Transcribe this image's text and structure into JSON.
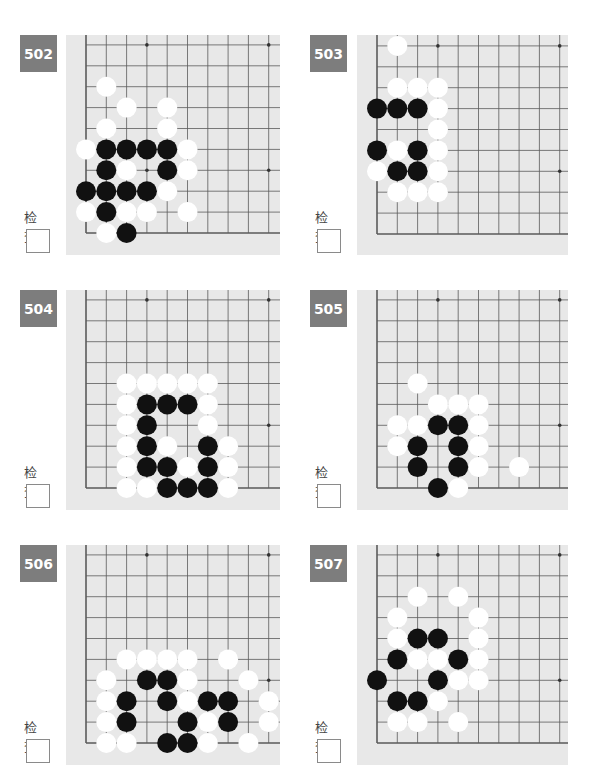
{
  "check_label": "检查",
  "colors": {
    "badge_bg": "#7d7d7d",
    "board_bg": "#e8e8e8",
    "grid_line": "#5a5a5a",
    "black_stone": "#111111",
    "white_stone": "#ffffff"
  },
  "grid": {
    "col_spacing": 20.3,
    "row_spacing": 20.9,
    "stone_radius": 10
  },
  "problems": [
    {
      "number": "502",
      "badge": {
        "x": 20,
        "y": 35
      },
      "check": {
        "label_x": 24,
        "label_y": 207,
        "box_x": 26,
        "box_y": 229
      },
      "panel": {
        "x": 66,
        "y": 35,
        "w": 214,
        "h": 220
      },
      "origin": {
        "x": 86,
        "y": 233
      },
      "top_line_y": 45,
      "star_points": [
        [
          3,
          9
        ],
        [
          9,
          9
        ],
        [
          3,
          3
        ],
        [
          9,
          3
        ]
      ],
      "stones": [
        {
          "c": 1,
          "r": 7,
          "color": "W"
        },
        {
          "c": 2,
          "r": 6,
          "color": "W"
        },
        {
          "c": 4,
          "r": 6,
          "color": "W"
        },
        {
          "c": 1,
          "r": 5,
          "color": "W"
        },
        {
          "c": 4,
          "r": 5,
          "color": "W"
        },
        {
          "c": 0,
          "r": 4,
          "color": "W"
        },
        {
          "c": 1,
          "r": 4,
          "color": "B"
        },
        {
          "c": 2,
          "r": 4,
          "color": "B"
        },
        {
          "c": 3,
          "r": 4,
          "color": "B"
        },
        {
          "c": 4,
          "r": 4,
          "color": "B"
        },
        {
          "c": 5,
          "r": 4,
          "color": "W"
        },
        {
          "c": 1,
          "r": 3,
          "color": "B"
        },
        {
          "c": 2,
          "r": 3,
          "color": "W"
        },
        {
          "c": 4,
          "r": 3,
          "color": "B"
        },
        {
          "c": 5,
          "r": 3,
          "color": "W"
        },
        {
          "c": 0,
          "r": 2,
          "color": "B"
        },
        {
          "c": 1,
          "r": 2,
          "color": "B"
        },
        {
          "c": 2,
          "r": 2,
          "color": "B"
        },
        {
          "c": 3,
          "r": 2,
          "color": "B"
        },
        {
          "c": 4,
          "r": 2,
          "color": "W"
        },
        {
          "c": 0,
          "r": 1,
          "color": "W"
        },
        {
          "c": 1,
          "r": 1,
          "color": "B"
        },
        {
          "c": 2,
          "r": 1,
          "color": "W"
        },
        {
          "c": 3,
          "r": 1,
          "color": "W"
        },
        {
          "c": 5,
          "r": 1,
          "color": "W"
        },
        {
          "c": 1,
          "r": 0,
          "color": "W"
        },
        {
          "c": 2,
          "r": 0,
          "color": "B"
        }
      ]
    },
    {
      "number": "503",
      "badge": {
        "x": 310,
        "y": 35
      },
      "check": {
        "label_x": 315,
        "label_y": 207,
        "box_x": 317,
        "box_y": 229
      },
      "panel": {
        "x": 357,
        "y": 35,
        "w": 211,
        "h": 220
      },
      "origin": {
        "x": 377,
        "y": 234
      },
      "top_line_y": 45,
      "star_points": [
        [
          3,
          9
        ],
        [
          9,
          9
        ],
        [
          9,
          3
        ]
      ],
      "stones": [
        {
          "c": 1,
          "r": 9,
          "color": "W"
        },
        {
          "c": 1,
          "r": 7,
          "color": "W"
        },
        {
          "c": 2,
          "r": 7,
          "color": "W"
        },
        {
          "c": 3,
          "r": 7,
          "color": "W"
        },
        {
          "c": 0,
          "r": 6,
          "color": "B"
        },
        {
          "c": 1,
          "r": 6,
          "color": "B"
        },
        {
          "c": 2,
          "r": 6,
          "color": "B"
        },
        {
          "c": 3,
          "r": 6,
          "color": "W"
        },
        {
          "c": 3,
          "r": 5,
          "color": "W"
        },
        {
          "c": 0,
          "r": 4,
          "color": "B"
        },
        {
          "c": 1,
          "r": 4,
          "color": "W"
        },
        {
          "c": 2,
          "r": 4,
          "color": "B"
        },
        {
          "c": 3,
          "r": 4,
          "color": "W"
        },
        {
          "c": 0,
          "r": 3,
          "color": "W"
        },
        {
          "c": 1,
          "r": 3,
          "color": "B"
        },
        {
          "c": 2,
          "r": 3,
          "color": "B"
        },
        {
          "c": 3,
          "r": 3,
          "color": "W"
        },
        {
          "c": 1,
          "r": 2,
          "color": "W"
        },
        {
          "c": 2,
          "r": 2,
          "color": "W"
        },
        {
          "c": 3,
          "r": 2,
          "color": "W"
        }
      ]
    },
    {
      "number": "504",
      "badge": {
        "x": 20,
        "y": 290
      },
      "check": {
        "label_x": 24,
        "label_y": 462,
        "box_x": 26,
        "box_y": 484
      },
      "panel": {
        "x": 66,
        "y": 290,
        "w": 214,
        "h": 220
      },
      "origin": {
        "x": 86,
        "y": 488
      },
      "top_line_y": 300,
      "star_points": [
        [
          3,
          9
        ],
        [
          9,
          9
        ],
        [
          9,
          3
        ]
      ],
      "stones": [
        {
          "c": 2,
          "r": 5,
          "color": "W"
        },
        {
          "c": 3,
          "r": 5,
          "color": "W"
        },
        {
          "c": 4,
          "r": 5,
          "color": "W"
        },
        {
          "c": 5,
          "r": 5,
          "color": "W"
        },
        {
          "c": 6,
          "r": 5,
          "color": "W"
        },
        {
          "c": 2,
          "r": 4,
          "color": "W"
        },
        {
          "c": 3,
          "r": 4,
          "color": "B"
        },
        {
          "c": 4,
          "r": 4,
          "color": "B"
        },
        {
          "c": 5,
          "r": 4,
          "color": "B"
        },
        {
          "c": 6,
          "r": 4,
          "color": "W"
        },
        {
          "c": 2,
          "r": 3,
          "color": "W"
        },
        {
          "c": 3,
          "r": 3,
          "color": "B"
        },
        {
          "c": 6,
          "r": 3,
          "color": "W"
        },
        {
          "c": 2,
          "r": 2,
          "color": "W"
        },
        {
          "c": 3,
          "r": 2,
          "color": "B"
        },
        {
          "c": 4,
          "r": 2,
          "color": "W"
        },
        {
          "c": 6,
          "r": 2,
          "color": "B"
        },
        {
          "c": 7,
          "r": 2,
          "color": "W"
        },
        {
          "c": 2,
          "r": 1,
          "color": "W"
        },
        {
          "c": 3,
          "r": 1,
          "color": "B"
        },
        {
          "c": 4,
          "r": 1,
          "color": "B"
        },
        {
          "c": 5,
          "r": 1,
          "color": "W"
        },
        {
          "c": 6,
          "r": 1,
          "color": "B"
        },
        {
          "c": 7,
          "r": 1,
          "color": "W"
        },
        {
          "c": 2,
          "r": 0,
          "color": "W"
        },
        {
          "c": 3,
          "r": 0,
          "color": "W"
        },
        {
          "c": 4,
          "r": 0,
          "color": "B"
        },
        {
          "c": 5,
          "r": 0,
          "color": "B"
        },
        {
          "c": 6,
          "r": 0,
          "color": "B"
        },
        {
          "c": 7,
          "r": 0,
          "color": "W"
        }
      ]
    },
    {
      "number": "505",
      "badge": {
        "x": 310,
        "y": 290
      },
      "check": {
        "label_x": 315,
        "label_y": 462,
        "box_x": 317,
        "box_y": 484
      },
      "panel": {
        "x": 357,
        "y": 290,
        "w": 211,
        "h": 220
      },
      "origin": {
        "x": 377,
        "y": 488
      },
      "top_line_y": 300,
      "star_points": [
        [
          3,
          9
        ],
        [
          9,
          9
        ],
        [
          9,
          3
        ]
      ],
      "stones": [
        {
          "c": 2,
          "r": 5,
          "color": "W"
        },
        {
          "c": 3,
          "r": 4,
          "color": "W"
        },
        {
          "c": 4,
          "r": 4,
          "color": "W"
        },
        {
          "c": 5,
          "r": 4,
          "color": "W"
        },
        {
          "c": 1,
          "r": 3,
          "color": "W"
        },
        {
          "c": 2,
          "r": 3,
          "color": "W"
        },
        {
          "c": 3,
          "r": 3,
          "color": "B"
        },
        {
          "c": 4,
          "r": 3,
          "color": "B"
        },
        {
          "c": 5,
          "r": 3,
          "color": "W"
        },
        {
          "c": 1,
          "r": 2,
          "color": "W"
        },
        {
          "c": 2,
          "r": 2,
          "color": "B"
        },
        {
          "c": 4,
          "r": 2,
          "color": "B"
        },
        {
          "c": 5,
          "r": 2,
          "color": "W"
        },
        {
          "c": 2,
          "r": 1,
          "color": "B"
        },
        {
          "c": 4,
          "r": 1,
          "color": "B"
        },
        {
          "c": 5,
          "r": 1,
          "color": "W"
        },
        {
          "c": 7,
          "r": 1,
          "color": "W"
        },
        {
          "c": 3,
          "r": 0,
          "color": "B"
        },
        {
          "c": 4,
          "r": 0,
          "color": "W"
        }
      ]
    },
    {
      "number": "506",
      "badge": {
        "x": 20,
        "y": 545
      },
      "check": {
        "label_x": 24,
        "label_y": 717,
        "box_x": 26,
        "box_y": 739
      },
      "panel": {
        "x": 66,
        "y": 545,
        "w": 214,
        "h": 220
      },
      "origin": {
        "x": 86,
        "y": 743
      },
      "top_line_y": 555,
      "star_points": [
        [
          3,
          9
        ],
        [
          9,
          9
        ],
        [
          9,
          3
        ]
      ],
      "stones": [
        {
          "c": 2,
          "r": 4,
          "color": "W"
        },
        {
          "c": 3,
          "r": 4,
          "color": "W"
        },
        {
          "c": 4,
          "r": 4,
          "color": "W"
        },
        {
          "c": 5,
          "r": 4,
          "color": "W"
        },
        {
          "c": 7,
          "r": 4,
          "color": "W"
        },
        {
          "c": 1,
          "r": 3,
          "color": "W"
        },
        {
          "c": 3,
          "r": 3,
          "color": "B"
        },
        {
          "c": 4,
          "r": 3,
          "color": "B"
        },
        {
          "c": 5,
          "r": 3,
          "color": "W"
        },
        {
          "c": 8,
          "r": 3,
          "color": "W"
        },
        {
          "c": 1,
          "r": 2,
          "color": "W"
        },
        {
          "c": 2,
          "r": 2,
          "color": "B"
        },
        {
          "c": 4,
          "r": 2,
          "color": "B"
        },
        {
          "c": 5,
          "r": 2,
          "color": "W"
        },
        {
          "c": 6,
          "r": 2,
          "color": "B"
        },
        {
          "c": 7,
          "r": 2,
          "color": "B"
        },
        {
          "c": 9,
          "r": 2,
          "color": "W"
        },
        {
          "c": 1,
          "r": 1,
          "color": "W"
        },
        {
          "c": 2,
          "r": 1,
          "color": "B"
        },
        {
          "c": 5,
          "r": 1,
          "color": "B"
        },
        {
          "c": 6,
          "r": 1,
          "color": "W"
        },
        {
          "c": 7,
          "r": 1,
          "color": "B"
        },
        {
          "c": 9,
          "r": 1,
          "color": "W"
        },
        {
          "c": 1,
          "r": 0,
          "color": "W"
        },
        {
          "c": 2,
          "r": 0,
          "color": "W"
        },
        {
          "c": 4,
          "r": 0,
          "color": "B"
        },
        {
          "c": 5,
          "r": 0,
          "color": "B"
        },
        {
          "c": 6,
          "r": 0,
          "color": "W"
        },
        {
          "c": 8,
          "r": 0,
          "color": "W"
        }
      ]
    },
    {
      "number": "507",
      "badge": {
        "x": 310,
        "y": 545
      },
      "check": {
        "label_x": 315,
        "label_y": 717,
        "box_x": 317,
        "box_y": 739
      },
      "panel": {
        "x": 357,
        "y": 545,
        "w": 211,
        "h": 220
      },
      "origin": {
        "x": 377,
        "y": 743
      },
      "top_line_y": 555,
      "star_points": [
        [
          3,
          9
        ],
        [
          9,
          9
        ],
        [
          9,
          3
        ]
      ],
      "stones": [
        {
          "c": 2,
          "r": 7,
          "color": "W"
        },
        {
          "c": 4,
          "r": 7,
          "color": "W"
        },
        {
          "c": 1,
          "r": 6,
          "color": "W"
        },
        {
          "c": 5,
          "r": 6,
          "color": "W"
        },
        {
          "c": 1,
          "r": 5,
          "color": "W"
        },
        {
          "c": 2,
          "r": 5,
          "color": "B"
        },
        {
          "c": 3,
          "r": 5,
          "color": "B"
        },
        {
          "c": 5,
          "r": 5,
          "color": "W"
        },
        {
          "c": 1,
          "r": 4,
          "color": "B"
        },
        {
          "c": 2,
          "r": 4,
          "color": "W"
        },
        {
          "c": 3,
          "r": 4,
          "color": "W"
        },
        {
          "c": 4,
          "r": 4,
          "color": "B"
        },
        {
          "c": 5,
          "r": 4,
          "color": "W"
        },
        {
          "c": 0,
          "r": 3,
          "color": "B"
        },
        {
          "c": 3,
          "r": 3,
          "color": "B"
        },
        {
          "c": 4,
          "r": 3,
          "color": "W"
        },
        {
          "c": 5,
          "r": 3,
          "color": "W"
        },
        {
          "c": 1,
          "r": 2,
          "color": "B"
        },
        {
          "c": 2,
          "r": 2,
          "color": "B"
        },
        {
          "c": 3,
          "r": 2,
          "color": "W"
        },
        {
          "c": 1,
          "r": 1,
          "color": "W"
        },
        {
          "c": 2,
          "r": 1,
          "color": "W"
        },
        {
          "c": 4,
          "r": 1,
          "color": "W"
        }
      ]
    }
  ]
}
